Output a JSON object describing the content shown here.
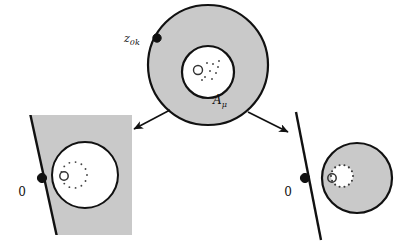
{
  "figure": {
    "background_color": "#ffffff",
    "width": 409,
    "height": 250,
    "fill_gray": "#c9c9c9",
    "stroke_color": "#111111",
    "white": "#ffffff"
  },
  "labels": {
    "z0k": "z",
    "z0k_sub": "0k",
    "a_mu": "A",
    "a_mu_sub": "μ",
    "zero_left": "0",
    "zero_right": "0"
  },
  "panels": {
    "top": {
      "name": "annulus-panel",
      "outer_circle": {
        "cx": 208,
        "cy": 65,
        "r": 60
      },
      "inner_circle": {
        "cx": 208,
        "cy": 72,
        "r": 26
      },
      "marked_point": {
        "cx": 157,
        "cy": 38,
        "r": 4.2
      },
      "label_z0k_pos": {
        "x": 124,
        "y": 42
      },
      "label_a_mu_pos": {
        "x": 213,
        "y": 104
      },
      "small_circle": {
        "cx": 198,
        "cy": 70,
        "r": 4.5
      },
      "dots": [
        {
          "x": 207,
          "y": 63
        },
        {
          "x": 213,
          "y": 64
        },
        {
          "x": 218,
          "y": 67
        },
        {
          "x": 210,
          "y": 71
        },
        {
          "x": 216,
          "y": 73
        },
        {
          "x": 205,
          "y": 77
        },
        {
          "x": 212,
          "y": 79
        },
        {
          "x": 219,
          "y": 61
        },
        {
          "x": 202,
          "y": 80
        }
      ]
    },
    "bottom_left": {
      "name": "left-degenerate-panel",
      "rect": {
        "x": 14,
        "y": 115,
        "w": 118,
        "h": 120
      },
      "line": {
        "x1": 30,
        "y1": 113,
        "x2": 57,
        "y2": 237
      },
      "marked_point": {
        "cx": 42,
        "cy": 178,
        "r": 4.6
      },
      "label_zero_pos": {
        "x": 22,
        "y": 196
      },
      "white_circle": {
        "cx": 85,
        "cy": 175,
        "r": 33
      },
      "small_circle": {
        "cx": 64,
        "cy": 176,
        "r": 4.2
      },
      "dot_ring": {
        "cx": 74,
        "cy": 175,
        "r": 13,
        "count": 13
      }
    },
    "bottom_right": {
      "name": "right-degenerate-panel",
      "line": {
        "x1": 296,
        "y1": 112,
        "x2": 321,
        "y2": 240
      },
      "marked_point": {
        "cx": 305,
        "cy": 178,
        "r": 4.6
      },
      "label_zero_pos": {
        "x": 288,
        "y": 196
      },
      "gray_disk": {
        "cx": 357,
        "cy": 178,
        "r": 35
      },
      "hole": {
        "cx": 342,
        "cy": 176,
        "r": 11
      },
      "small_circle": {
        "cx": 332,
        "cy": 178,
        "r": 4.2
      }
    }
  },
  "arrows": {
    "left_arrow": {
      "x1": 170,
      "y1": 110,
      "x2": 134,
      "y2": 129
    },
    "right_arrow": {
      "x1": 248,
      "y1": 112,
      "x2": 288,
      "y2": 132
    }
  }
}
